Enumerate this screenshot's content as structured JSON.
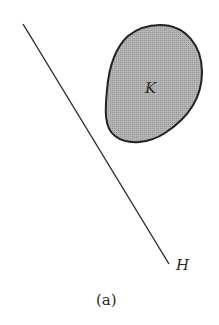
{
  "figure": {
    "caption": "(a)",
    "line": {
      "label": "H",
      "color": "#2a2a2a"
    },
    "region": {
      "label": "K",
      "fill": "#a9a9a9",
      "stroke": "#222222"
    }
  }
}
